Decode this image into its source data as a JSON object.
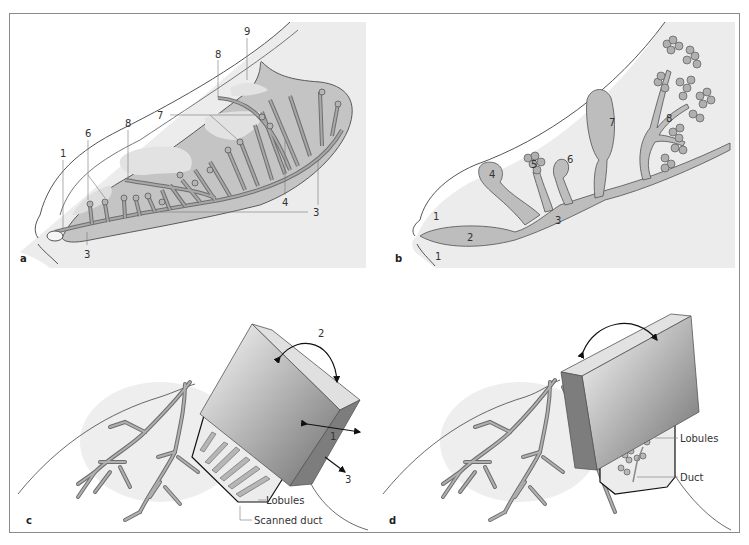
{
  "figure": {
    "colors": {
      "frame": "#8a8a8a",
      "panel_bg": "#ededed",
      "tissue_light": "#dcdcdc",
      "tissue_mid": "#c2c2c2",
      "duct": "#a8a8a8",
      "duct_stroke": "#6e6e6e",
      "outline": "#555555",
      "probe_dark": "#7a7a7a",
      "probe_light": "#e6e6e6"
    },
    "panels": [
      {
        "id": "a",
        "letter": "a",
        "labels": [
          "1",
          "3",
          "3",
          "3",
          "4",
          "6",
          "7",
          "8",
          "8",
          "9"
        ]
      },
      {
        "id": "b",
        "letter": "b",
        "labels": [
          "1",
          "1",
          "2",
          "3",
          "4",
          "5",
          "6",
          "7",
          "8"
        ]
      },
      {
        "id": "c",
        "letter": "c",
        "arrows": [
          "1",
          "2",
          "3"
        ],
        "callouts": [
          "Lobules",
          "Scanned duct"
        ]
      },
      {
        "id": "d",
        "letter": "d",
        "callouts": [
          "Lobules",
          "Duct"
        ]
      }
    ]
  },
  "panel_a": {
    "letter": "a",
    "l1": "1",
    "l3a": "3",
    "l3b": "3",
    "l3c": "3",
    "l4": "4",
    "l6": "6",
    "l7": "7",
    "l8a": "8",
    "l8b": "8",
    "l9": "9"
  },
  "panel_b": {
    "letter": "b",
    "l1a": "1",
    "l1b": "1",
    "l2": "2",
    "l3": "3",
    "l4": "4",
    "l5": "5",
    "l6": "6",
    "l7": "7",
    "l8": "8"
  },
  "panel_c": {
    "letter": "c",
    "arrow1": "1",
    "arrow2": "2",
    "arrow3": "3",
    "lobules": "Lobules",
    "scanned_duct": "Scanned duct"
  },
  "panel_d": {
    "letter": "d",
    "lobules": "Lobules",
    "duct": "Duct"
  }
}
